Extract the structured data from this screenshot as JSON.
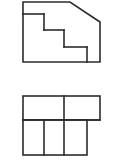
{
  "document": {
    "title": "Orthographic Projection Drawing",
    "background_color": "#ffffff",
    "line_color": "#2b2b2b",
    "line_width": 1.6,
    "canvas": {
      "width": 123,
      "height": 165
    }
  },
  "views": [
    {
      "id": "front-elevation",
      "name": "front-elevation-view",
      "description": "Stepped profile with chamfered upper-right corner",
      "outline_points": "23,2 70,2 100,22 100,62 23,62",
      "vertices": [
        {
          "x": 23,
          "y": 2
        },
        {
          "x": 70,
          "y": 2
        },
        {
          "x": 100,
          "y": 22
        },
        {
          "x": 100,
          "y": 62
        },
        {
          "x": 23,
          "y": 62
        }
      ],
      "steps": [
        {
          "id": "step-tread-1",
          "x1": 23,
          "y1": 14,
          "x2": 44,
          "y2": 14
        },
        {
          "id": "step-riser-1",
          "x1": 44,
          "y1": 14,
          "x2": 44,
          "y2": 30
        },
        {
          "id": "step-tread-2",
          "x1": 44,
          "y1": 30,
          "x2": 64,
          "y2": 30
        },
        {
          "id": "step-riser-2",
          "x1": 64,
          "y1": 30,
          "x2": 64,
          "y2": 47
        },
        {
          "id": "step-tread-3",
          "x1": 64,
          "y1": 47,
          "x2": 87,
          "y2": 47
        },
        {
          "id": "step-riser-3",
          "x1": 87,
          "y1": 47,
          "x2": 87,
          "y2": 62
        }
      ]
    },
    {
      "id": "plan-view",
      "name": "plan-top-view",
      "description": "Upper band split in two cells, lower band split in three cells",
      "upper_band": {
        "id": "upper-band",
        "x": 23,
        "y": 96,
        "width": 77,
        "height": 24,
        "dividers": [
          {
            "id": "upper-divider-1",
            "x1": 64,
            "y1": 96,
            "x2": 64,
            "y2": 120
          }
        ]
      },
      "lower_band": {
        "id": "lower-band",
        "x": 23,
        "y": 120,
        "width": 64,
        "height": 35,
        "dividers": [
          {
            "id": "lower-divider-1",
            "x1": 44,
            "y1": 120,
            "x2": 44,
            "y2": 155
          },
          {
            "id": "lower-divider-2",
            "x1": 64,
            "y1": 120,
            "x2": 64,
            "y2": 155
          }
        ]
      }
    }
  ]
}
